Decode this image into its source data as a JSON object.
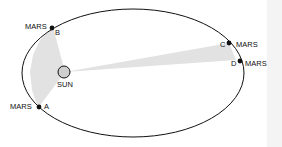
{
  "diagram": {
    "sun_label": "SUN",
    "points": [
      {
        "id": "A",
        "label": "A",
        "planet": "MARS"
      },
      {
        "id": "B",
        "label": "B",
        "planet": "MARS"
      },
      {
        "id": "C",
        "label": "C",
        "planet": "MARS"
      },
      {
        "id": "D",
        "label": "D",
        "planet": "MARS"
      }
    ],
    "colors": {
      "orbit": "#111111",
      "sector": "#e2e2e2",
      "sun_fill": "#cfcfcf",
      "planet": "#111111"
    }
  }
}
